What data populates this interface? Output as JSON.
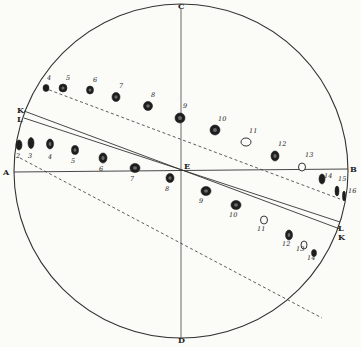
{
  "diagram": {
    "circle": {
      "cx": 181,
      "cy": 171,
      "r": 167,
      "color": "#333333"
    },
    "axes": {
      "vertical": {
        "x1": 181,
        "y1": 8,
        "x2": 181,
        "y2": 338
      },
      "horizontal": {
        "x1": 14,
        "y1": 172,
        "x2": 348,
        "y2": 169
      }
    },
    "points": {
      "C": {
        "label": "C",
        "x": 178,
        "y": 9
      },
      "D": {
        "label": "D",
        "x": 178,
        "y": 343
      },
      "A": {
        "label": "A",
        "x": 3,
        "y": 175
      },
      "B": {
        "label": "B",
        "x": 350,
        "y": 172
      },
      "E": {
        "label": "E",
        "x": 184,
        "y": 169
      },
      "K_left": {
        "label": "K",
        "x": 17,
        "y": 113
      },
      "L_left": {
        "label": "L",
        "x": 17,
        "y": 122
      },
      "L_right": {
        "label": "L",
        "x": 338,
        "y": 231
      },
      "K_right": {
        "label": "K",
        "x": 338,
        "y": 240
      }
    },
    "parallel_lines": [
      {
        "name": "K",
        "x1": 24,
        "y1": 111,
        "x2": 340,
        "y2": 229
      },
      {
        "name": "L",
        "x1": 24,
        "y1": 118,
        "x2": 340,
        "y2": 222
      }
    ],
    "dashed_paths": [
      {
        "name": "upper-track",
        "x1": 44,
        "y1": 88,
        "x2": 340,
        "y2": 199
      },
      {
        "name": "lower-track",
        "x1": 20,
        "y1": 158,
        "x2": 322,
        "y2": 318
      }
    ],
    "upper_spots": [
      {
        "n": "4",
        "x": 46,
        "y": 88,
        "rx": 3,
        "ry": 3.5,
        "filled": true,
        "lx": 47,
        "ly": 80
      },
      {
        "n": "5",
        "x": 63,
        "y": 88,
        "rx": 4,
        "ry": 4,
        "filled": true,
        "lx": 66,
        "ly": 80
      },
      {
        "n": "6",
        "x": 90,
        "y": 90,
        "rx": 3.5,
        "ry": 4,
        "filled": true,
        "lx": 93,
        "ly": 82
      },
      {
        "n": "7",
        "x": 116,
        "y": 97,
        "rx": 4,
        "ry": 4.5,
        "filled": true,
        "lx": 119,
        "ly": 88
      },
      {
        "n": "8",
        "x": 148,
        "y": 106,
        "rx": 4.5,
        "ry": 4.5,
        "filled": true,
        "lx": 151,
        "ly": 97
      },
      {
        "n": "9",
        "x": 180,
        "y": 118,
        "rx": 5,
        "ry": 5,
        "filled": true,
        "lx": 183,
        "ly": 108
      },
      {
        "n": "10",
        "x": 215,
        "y": 130,
        "rx": 5,
        "ry": 5,
        "filled": true,
        "lx": 218,
        "ly": 121
      },
      {
        "n": "11",
        "x": 246,
        "y": 142,
        "rx": 5,
        "ry": 4,
        "filled": false,
        "lx": 249,
        "ly": 133
      },
      {
        "n": "12",
        "x": 275,
        "y": 156,
        "rx": 4,
        "ry": 5,
        "filled": true,
        "lx": 278,
        "ly": 146
      },
      {
        "n": "13",
        "x": 302,
        "y": 167,
        "rx": 3.5,
        "ry": 4,
        "filled": false,
        "lx": 305,
        "ly": 157
      },
      {
        "n": "14",
        "x": 322,
        "y": 179,
        "rx": 3,
        "ry": 5,
        "filled": true,
        "lx": 324,
        "ly": 178
      },
      {
        "n": "15",
        "x": 337,
        "y": 191,
        "rx": 2,
        "ry": 5,
        "filled": true,
        "lx": 338,
        "ly": 181
      },
      {
        "n": "16",
        "x": 344,
        "y": 196,
        "rx": 1.5,
        "ry": 5,
        "filled": true,
        "lx": 348,
        "ly": 193
      }
    ],
    "lower_spots": [
      {
        "n": "2",
        "x": 19,
        "y": 145,
        "rx": 3,
        "ry": 5,
        "filled": true,
        "lx": 16,
        "ly": 158
      },
      {
        "n": "3",
        "x": 31,
        "y": 143,
        "rx": 3,
        "ry": 5.5,
        "filled": true,
        "lx": 28,
        "ly": 158
      },
      {
        "n": "4",
        "x": 50,
        "y": 144,
        "rx": 3.5,
        "ry": 5,
        "filled": true,
        "lx": 48,
        "ly": 159
      },
      {
        "n": "5",
        "x": 75,
        "y": 150,
        "rx": 3.5,
        "ry": 4.5,
        "filled": true,
        "lx": 71,
        "ly": 163
      },
      {
        "n": "6",
        "x": 103,
        "y": 158,
        "rx": 4,
        "ry": 5,
        "filled": true,
        "lx": 99,
        "ly": 171
      },
      {
        "n": "7",
        "x": 135,
        "y": 168,
        "rx": 5,
        "ry": 4.5,
        "filled": true,
        "lx": 130,
        "ly": 181
      },
      {
        "n": "8",
        "x": 170,
        "y": 178,
        "rx": 4,
        "ry": 4.5,
        "filled": true,
        "lx": 165,
        "ly": 191
      },
      {
        "n": "9",
        "x": 206,
        "y": 191,
        "rx": 5,
        "ry": 4.5,
        "filled": true,
        "lx": 199,
        "ly": 203
      },
      {
        "n": "10",
        "x": 236,
        "y": 205,
        "rx": 5,
        "ry": 4.5,
        "filled": true,
        "lx": 229,
        "ly": 217
      },
      {
        "n": "11",
        "x": 264,
        "y": 220,
        "rx": 3.5,
        "ry": 4,
        "filled": false,
        "lx": 257,
        "ly": 231
      },
      {
        "n": "12",
        "x": 289,
        "y": 235,
        "rx": 3.5,
        "ry": 5,
        "filled": true,
        "lx": 282,
        "ly": 246
      },
      {
        "n": "13",
        "x": 304,
        "y": 245,
        "rx": 3,
        "ry": 4,
        "filled": false,
        "lx": 296,
        "ly": 251
      },
      {
        "n": "14",
        "x": 314,
        "y": 253,
        "rx": 2.5,
        "ry": 3.5,
        "filled": true,
        "lx": 307,
        "ly": 260
      }
    ]
  }
}
